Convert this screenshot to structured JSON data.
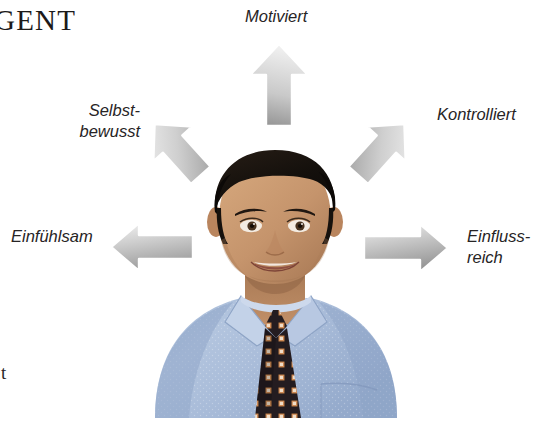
{
  "headline": {
    "text": "GENT",
    "note_cropped": true
  },
  "stray_text": {
    "text": "t"
  },
  "diagram": {
    "type": "radial-attribute-diagram",
    "center_subject": "businessman-portrait",
    "labels": [
      {
        "id": "motiviert",
        "text": "Motiviert",
        "direction": "up",
        "arrow": "arrow-up"
      },
      {
        "id": "selbstbewusst",
        "text": "Selbst-\nbewusst",
        "direction": "up-left",
        "arrow": "arrow-up-left"
      },
      {
        "id": "kontrolliert",
        "text": "Kontrolliert",
        "direction": "up-right",
        "arrow": "arrow-up-right"
      },
      {
        "id": "einfuehlsam",
        "text": "Einfühlsam",
        "direction": "left",
        "arrow": "arrow-left"
      },
      {
        "id": "einflussreich",
        "text": "Einfluss-\nreich",
        "direction": "right",
        "arrow": "arrow-right"
      }
    ],
    "arrow_count": 5
  },
  "colors": {
    "background": "#ffffff",
    "text": "#272425",
    "headline_text": "#1c1a1a",
    "arrow_fill_light": "#f2f2f2",
    "arrow_fill_mid": "#d3d3d3",
    "arrow_fill_dark": "#9a9a9a",
    "arrow_outline": "#ffffff",
    "shirt_blue": "#a8bcd8",
    "shirt_blue_dark": "#8ca3c4",
    "skin": "#c99a72",
    "skin_shadow": "#a87b56",
    "hair": "#16110e",
    "tie_dark": "#241c1f",
    "tie_accent": "#c97a4a"
  },
  "photo": {
    "subject": "man-in-blue-dress-shirt-and-patterned-tie",
    "alt": "Portrait of a smiling man with dark hair wearing a light blue shirt and a dark patterned necktie"
  }
}
